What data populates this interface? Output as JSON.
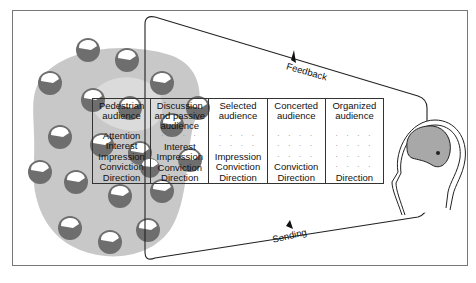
{
  "diagram": {
    "type": "audience-communication-funnel",
    "flows": {
      "feedback_label": "Feedback",
      "sending_label": "Sending"
    },
    "stages": [
      {
        "header": "Pedestrian audience",
        "header_lines": [
          "Pedestrian",
          "audience"
        ],
        "rows": [
          "Attention",
          "Interest",
          "Impression",
          "Conviction",
          "Direction"
        ]
      },
      {
        "header": "Discussion and passive audience",
        "header_lines": [
          "Discussion",
          "and passive",
          "audience"
        ],
        "rows": [
          "· · · ·",
          "Interest",
          "Impression",
          "Conviction",
          "Direction"
        ]
      },
      {
        "header": "Selected audience",
        "header_lines": [
          "Selected",
          "audience"
        ],
        "rows": [
          "· · · ·",
          "· · · ·",
          "Impression",
          "Conviction",
          "Direction"
        ]
      },
      {
        "header": "Concerted audience",
        "header_lines": [
          "Concerted",
          "audience"
        ],
        "rows": [
          "· · · ·",
          "· · · ·",
          "· · · ·",
          "Conviction",
          "Direction"
        ]
      },
      {
        "header": "Organized audience",
        "header_lines": [
          "Organized",
          "audience"
        ],
        "rows": [
          "· · · ·",
          "· · · ·",
          "· · · ·",
          "· · · ·",
          "Direction"
        ]
      }
    ],
    "crowd": {
      "description": "crowd of heads in grey cloud",
      "head_count": 20
    },
    "speaker": {
      "description": "single head profile on right facing left"
    },
    "colors": {
      "line": "#222222",
      "cloud": "#c8c8c8",
      "head_dark": "#6e6e6e",
      "head_light": "#ffffff",
      "brain": "#a8a8a8",
      "frame": "#777777"
    }
  }
}
